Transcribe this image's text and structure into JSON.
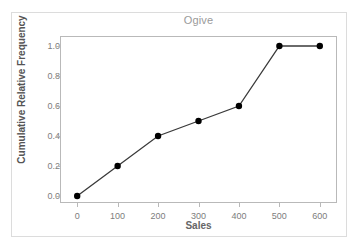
{
  "chart_data": {
    "type": "line",
    "title": "Ogive",
    "xlabel": "Sales",
    "ylabel": "Cumulative Relative Frequency",
    "x": [
      0,
      100,
      200,
      300,
      400,
      500,
      600
    ],
    "values": [
      0.0,
      0.2,
      0.4,
      0.5,
      0.6,
      1.0,
      1.0
    ],
    "xlim": [
      -40,
      640
    ],
    "ylim": [
      -0.04,
      1.06
    ],
    "xticks": [
      0,
      100,
      200,
      300,
      400,
      500,
      600
    ],
    "xtick_labels": [
      "0",
      "100",
      "200",
      "300",
      "400",
      "500",
      "600"
    ],
    "yticks": [
      0.0,
      0.2,
      0.4,
      0.6,
      0.8,
      1.0
    ],
    "ytick_labels": [
      "0.0",
      "0.2",
      "0.4",
      "0.6",
      "0.8",
      "1.0"
    ],
    "grid": false,
    "legend": "none",
    "marker": "filled-circle",
    "marker_color": "#000000",
    "line_color": "#3a3a3a",
    "title_color": "#9a9a9a",
    "axis_label_color": "#5d5d5d",
    "tick_label_color": "#7d7d7d",
    "frame_color": "#b9b9b9",
    "outer_frame_color": "#dcdcdc",
    "background_color": "#ffffff"
  }
}
